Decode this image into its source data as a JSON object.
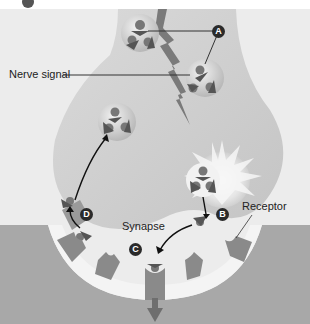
{
  "figure": {
    "header_badge": "",
    "labels": {
      "nerve_signal": "Nerve signal",
      "synapse": "Synapse",
      "receptor": "Receptor"
    },
    "step_badges": {
      "a": "A",
      "b": "B",
      "c": "C",
      "d": "D"
    },
    "colors": {
      "background": "#ececec",
      "terminal": "#d2d2d2",
      "postsynaptic": "#a8a8a8",
      "receptor": "#8a8a8a",
      "signal_arrow": "#7a7a7a",
      "synaptic_gap": "#f4f4f4"
    }
  }
}
